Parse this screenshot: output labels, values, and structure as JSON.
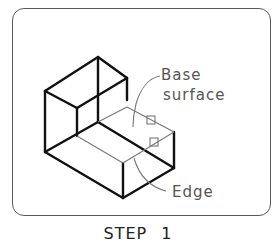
{
  "figure": {
    "labels": {
      "base_surface_line1": "Base",
      "base_surface_line2": "surface",
      "edge": "Edge"
    },
    "caption": "STEP 1"
  },
  "colors": {
    "frame": "#5a5a5a",
    "object_lines": "#111111",
    "thin_lines": "#777777",
    "label_text": "#555555",
    "caption_text": "#222222"
  }
}
